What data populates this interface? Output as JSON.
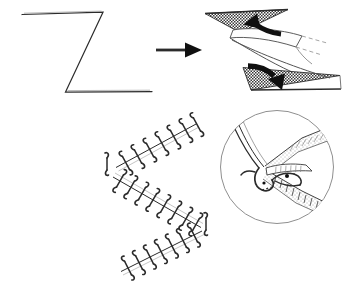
{
  "figure": {
    "background_color": "#ffffff",
    "ink_color": "#2b2b2b",
    "accent_color": "#101010",
    "width": 349,
    "height": 285,
    "panel_count": 4
  },
  "panels": [
    {
      "id": "panel-a",
      "name": "z-incision-outline",
      "role": "Planned Z-shaped incision marked on skin",
      "position": {
        "x": 10,
        "y": 5,
        "width": 150,
        "height": 100
      },
      "geometry": {
        "type": "polyline",
        "points": [
          [
            22,
            14
          ],
          [
            103,
            12
          ],
          [
            65,
            92
          ],
          [
            152,
            92
          ]
        ],
        "stroke_width": 1.1
      }
    },
    {
      "id": "panel-arrow",
      "name": "transition-arrow",
      "role": "Arrow indicating progression from planning to flap transposition",
      "direction": "right",
      "geometry": {
        "shaft": {
          "x1": 156,
          "y1": 50,
          "x2": 186,
          "y2": 50,
          "width": 2.6
        },
        "head": [
          [
            186,
            43
          ],
          [
            201,
            50
          ],
          [
            186,
            57
          ]
        ]
      }
    },
    {
      "id": "panel-b",
      "name": "flap-transposition-3d",
      "role": "Three-dimensional view of the two triangular flaps being transposed",
      "position": {
        "x": 198,
        "y": 4,
        "width": 148,
        "height": 100
      },
      "elements": [
        {
          "name": "upper-triangular-flap",
          "fill": "hatched",
          "apex": "down"
        },
        {
          "name": "lower-triangular-flap",
          "fill": "hatched",
          "apex": "up-left"
        },
        {
          "name": "central-transposed-limb",
          "fill": "white-outline"
        },
        {
          "name": "upper-transposition-arrow",
          "direction": "up-left",
          "style": "bold-curved"
        },
        {
          "name": "lower-transposition-arrow",
          "direction": "down-right",
          "style": "bold-curved"
        }
      ]
    },
    {
      "id": "panel-c",
      "name": "sutured-z-plasty",
      "role": "Completed Z-plasty closure with interrupted sutures along each limb",
      "position": {
        "x": 98,
        "y": 112,
        "width": 120,
        "height": 170
      },
      "limbs": [
        {
          "name": "upper-limb",
          "from": [
            118,
            168
          ],
          "to": [
            198,
            124
          ],
          "suture_count": 7
        },
        {
          "name": "middle-limb",
          "from": [
            112,
            178
          ],
          "to": [
            200,
            228
          ],
          "suture_count": 9
        },
        {
          "name": "lower-limb",
          "from": [
            122,
            272
          ],
          "to": [
            202,
            232
          ],
          "suture_count": 8
        }
      ],
      "corner_markers": [
        {
          "name": "left-corner-stitch",
          "at": [
            107,
            163
          ]
        },
        {
          "name": "right-corner-stitch",
          "at": [
            205,
            224
          ]
        }
      ]
    },
    {
      "id": "panel-d",
      "name": "corner-stitch-inset",
      "role": "Circular magnified inset of the half-buried horizontal mattress corner stitch at the flap tip",
      "position": {
        "x": 218,
        "y": 108,
        "width": 118,
        "height": 118
      },
      "circle": {
        "cx": 277,
        "cy": 167,
        "r": 57,
        "stroke": "#8a8a8a"
      },
      "elements": [
        {
          "name": "flap-tip-wedge",
          "description": "V-shaped flap tip entering the recipient angle"
        },
        {
          "name": "dermal-hatching",
          "description": "Cut dermal edge shown with fine parallel hatch lines"
        },
        {
          "name": "corner-suture-loop",
          "description": "Suture passing through dermis of flap tip"
        },
        {
          "name": "suture-strand",
          "description": "Trailing suture strands exiting to the upper left"
        }
      ]
    }
  ]
}
